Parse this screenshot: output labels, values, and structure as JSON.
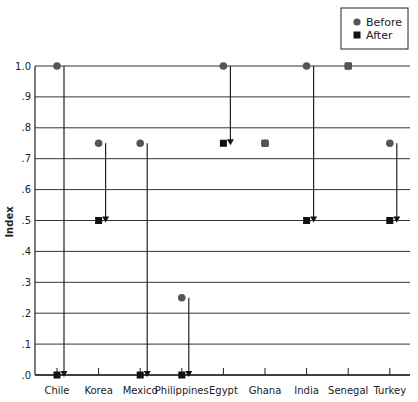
{
  "chart_data": {
    "type": "scatter",
    "title": "",
    "xlabel": "",
    "ylabel": "Index",
    "ylim": [
      0,
      1.0
    ],
    "yticks": [
      ".0",
      ".1",
      ".2",
      ".3",
      ".4",
      ".5",
      ".6",
      ".7",
      ".8",
      ".9",
      "1.0"
    ],
    "grid": true,
    "legend_position": "top-right",
    "categories": [
      "Chile",
      "Korea",
      "Mexico",
      "Philippines",
      "Egypt",
      "Ghana",
      "India",
      "Senegal",
      "Turkey"
    ],
    "series": [
      {
        "name": "Before",
        "marker": "circle",
        "color": "#555555",
        "values": [
          1.0,
          0.75,
          0.75,
          0.25,
          1.0,
          0.75,
          1.0,
          1.0,
          0.75
        ]
      },
      {
        "name": "After",
        "marker": "square",
        "color": "#111111",
        "values": [
          0.0,
          0.5,
          0.0,
          0.0,
          0.75,
          0.75,
          0.5,
          1.0,
          0.5
        ]
      }
    ],
    "annotations": "Downward arrows drawn from Before to After value for each country where the index decreased"
  },
  "legend": {
    "before_label": "Before",
    "after_label": "After"
  },
  "axis": {
    "ylabel": "Index"
  }
}
